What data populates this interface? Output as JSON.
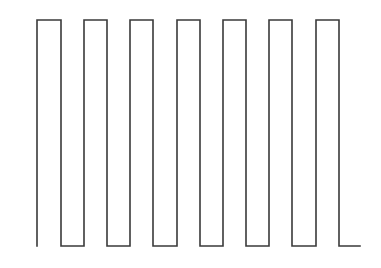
{
  "diagram": {
    "type": "square-wave",
    "stroke_color": "#3a3a3a",
    "background": "#ffffff",
    "stroke_width": 1.6,
    "high_y": 20,
    "low_y": 246,
    "start_x": 37,
    "end_x": 360,
    "start_y": 246,
    "pulses": [
      {
        "rise_x": 37,
        "fall_x": 61
      },
      {
        "rise_x": 84,
        "fall_x": 107
      },
      {
        "rise_x": 130,
        "fall_x": 153
      },
      {
        "rise_x": 177,
        "fall_x": 200
      },
      {
        "rise_x": 223,
        "fall_x": 246
      },
      {
        "rise_x": 269,
        "fall_x": 292
      },
      {
        "rise_x": 316,
        "fall_x": 339
      }
    ],
    "pulse_count": 7
  }
}
